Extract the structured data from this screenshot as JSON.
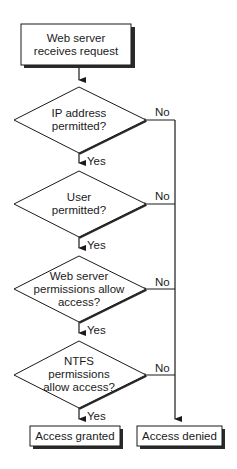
{
  "diagram": {
    "type": "flowchart",
    "start": {
      "text_line1": "Web server",
      "text_line2": "receives request"
    },
    "decisions": [
      {
        "lines": [
          "IP address",
          "permitted?"
        ],
        "yes_label": "Yes",
        "no_label": "No"
      },
      {
        "lines": [
          "User",
          "permitted?"
        ],
        "yes_label": "Yes",
        "no_label": "No"
      },
      {
        "lines": [
          "Web server",
          "permissions allow",
          "access?"
        ],
        "yes_label": "Yes",
        "no_label": "No"
      },
      {
        "lines": [
          "NTFS",
          "permissions",
          "allow access?"
        ],
        "yes_label": "Yes",
        "no_label": "No"
      }
    ],
    "outcomes": {
      "granted": "Access granted",
      "denied": "Access denied"
    },
    "colors": {
      "stroke": "#1a1a1a",
      "shadow": "#333333",
      "fill": "#ffffff"
    }
  }
}
